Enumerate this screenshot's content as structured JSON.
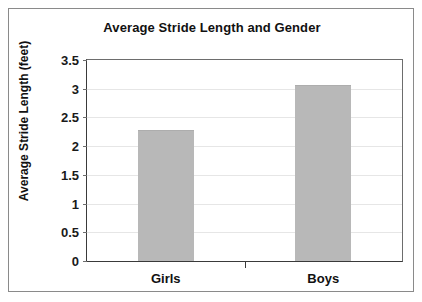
{
  "chart_data": {
    "type": "bar",
    "title": "Average Stride Length and Gender",
    "xlabel": "",
    "ylabel": "Average Stride Length (feet)",
    "categories": [
      "Girls",
      "Boys"
    ],
    "values": [
      2.28,
      3.06
    ],
    "ylim": [
      0,
      3.5
    ],
    "yticks": [
      0,
      0.5,
      1,
      1.5,
      2,
      2.5,
      3,
      3.5
    ],
    "ytick_labels": [
      "0",
      "0.5",
      "1",
      "1.5",
      "2",
      "2.5",
      "3",
      "3.5"
    ],
    "grid": true,
    "legend": "none",
    "bar_color": "#b8b8b8",
    "border_color": "#8a8a8a",
    "axis_color": "#3a3a3a",
    "gridline_color": "#e6e6e6",
    "text_color": "#111111"
  }
}
